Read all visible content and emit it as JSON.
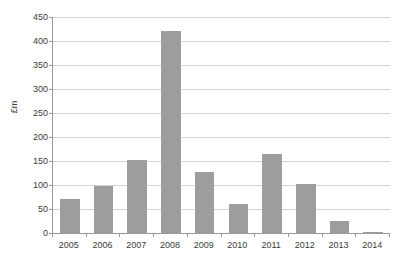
{
  "chart_data": {
    "type": "bar",
    "title": "",
    "subtitle": "",
    "xlabel": "",
    "ylabel": "£m",
    "categories": [
      "2005",
      "2006",
      "2007",
      "2008",
      "2009",
      "2010",
      "2011",
      "2012",
      "2013",
      "2014"
    ],
    "values": [
      70,
      97,
      152,
      420,
      128,
      60,
      165,
      102,
      25,
      3
    ],
    "series": [
      {
        "name": "",
        "values": [
          70,
          97,
          152,
          420,
          128,
          60,
          165,
          102,
          25,
          3
        ]
      }
    ],
    "ylim": [
      0,
      450
    ],
    "ytick_labels": [
      "0",
      "50",
      "100",
      "150",
      "200",
      "250",
      "300",
      "350",
      "400",
      "450"
    ],
    "ytick_values": [
      0,
      50,
      100,
      150,
      200,
      250,
      300,
      350,
      400,
      450
    ],
    "ytick_interval": 50,
    "grid": true,
    "grid_axis": "y",
    "legend": false,
    "legend_position": "none",
    "annotations": [],
    "colors": {
      "bar": "#9d9d9d",
      "gridline": "#d4d4d4",
      "axis": "#9a9a9a",
      "text": "#3b3b3b",
      "plot_background": "#ffffff",
      "figure_background": "#ffffff"
    }
  }
}
